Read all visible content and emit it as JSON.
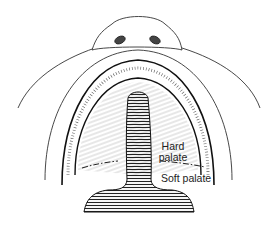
{
  "diagram": {
    "labels": {
      "hard_palate_line1": "Hard",
      "hard_palate_line2": "palate",
      "soft_palate": "Soft palate"
    },
    "colors": {
      "ink": "#222222",
      "background": "#ffffff"
    }
  }
}
